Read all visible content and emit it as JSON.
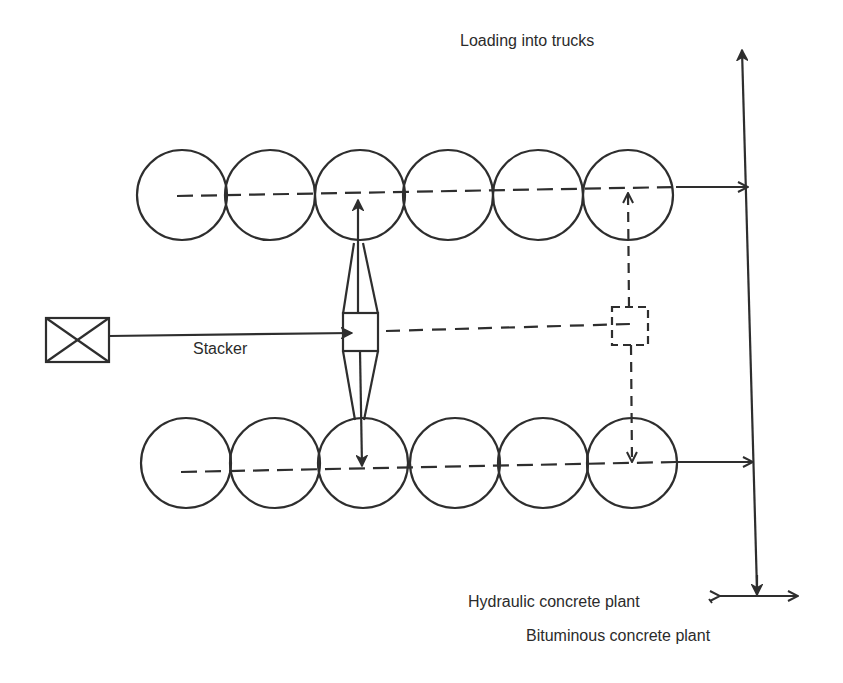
{
  "diagram": {
    "labels": {
      "loading": "Loading into trucks",
      "stacker": "Stacker",
      "hydraulic": "Hydraulic concrete plant",
      "bituminous": "Bituminous concrete plant"
    },
    "colors": {
      "stroke": "#2e2e2e",
      "background": "#ffffff"
    },
    "piles": {
      "top_row": {
        "count": 6,
        "cy": 195,
        "r": 45,
        "cx": [
          182,
          270,
          360,
          448,
          538,
          628
        ]
      },
      "bottom_row": {
        "count": 6,
        "cy": 463,
        "r": 45,
        "cx": [
          186,
          275,
          363,
          455,
          543,
          632
        ]
      }
    },
    "nodes": [
      {
        "id": "feed-source",
        "shape": "box-with-x"
      },
      {
        "id": "stacker",
        "shape": "box",
        "style": "solid"
      },
      {
        "id": "stacker-alt-position",
        "shape": "box",
        "style": "dashed"
      },
      {
        "id": "collector-conveyor",
        "shape": "vertical-line",
        "arrow": "up"
      },
      {
        "id": "plant-split",
        "shape": "horizontal-line",
        "arrow": "both"
      }
    ]
  }
}
